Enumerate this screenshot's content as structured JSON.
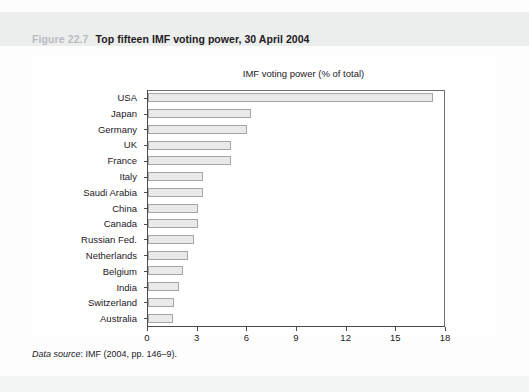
{
  "header": {
    "figure_number": "Figure 22.7",
    "figure_title": "Top fifteen IMF voting power, 30 April 2004"
  },
  "source_note": {
    "label": "Data source",
    "text": ": IMF (2004, pp. 146–9)."
  },
  "chart_data": {
    "type": "bar",
    "orientation": "horizontal",
    "title": "IMF voting power (% of total)",
    "xlabel": "",
    "ylabel": "",
    "xlim": [
      0,
      18
    ],
    "xticks": [
      0,
      3,
      6,
      9,
      12,
      15,
      18
    ],
    "xtick_labels": [
      "0",
      "3",
      "6",
      "9",
      "12",
      "15",
      "18"
    ],
    "grid": false,
    "legend": null,
    "categories": [
      "USA",
      "Japan",
      "Germany",
      "UK",
      "France",
      "Italy",
      "Saudi Arabia",
      "China",
      "Canada",
      "Russian Fed.",
      "Netherlands",
      "Belgium",
      "India",
      "Switzerland",
      "Australia"
    ],
    "values": [
      17.2,
      6.2,
      6.0,
      5.0,
      5.0,
      3.3,
      3.3,
      3.0,
      3.0,
      2.8,
      2.4,
      2.1,
      1.9,
      1.6,
      1.5
    ],
    "bar_fill": "#e9e9e9",
    "bar_border": "#a6a6a6"
  }
}
